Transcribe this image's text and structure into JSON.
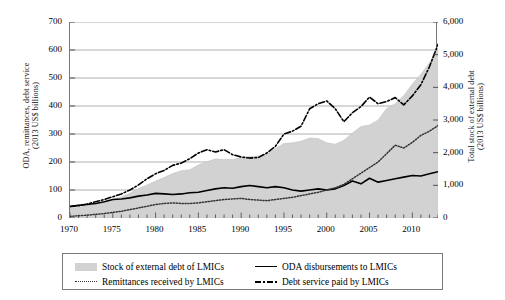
{
  "chart_data": {
    "type": "area",
    "title": "",
    "xlabel": "",
    "ylabel_left": "ODA, remittances, debt service\n(2013 US$ billions)",
    "ylabel_right": "Total stock of external debt\n(2013 US$ billions)",
    "grid": true,
    "legend_position": "bottom",
    "xlim": [
      1970,
      2013
    ],
    "ylim_left": [
      0,
      700
    ],
    "ylim_right": [
      0,
      6000
    ],
    "xticks": [
      1970,
      1975,
      1980,
      1985,
      1990,
      1995,
      2000,
      2005,
      2010
    ],
    "xtick_labels": [
      "1970",
      "1975",
      "1980",
      "1985",
      "1990",
      "1995",
      "2000",
      "2005",
      "2010"
    ],
    "yticks_left": [
      0,
      100,
      200,
      300,
      400,
      500,
      600,
      700
    ],
    "ytick_labels_left": [
      "0",
      "100",
      "200",
      "300",
      "400",
      "500",
      "600",
      "700"
    ],
    "yticks_right": [
      0,
      1000,
      2000,
      3000,
      4000,
      5000,
      6000
    ],
    "ytick_labels_right": [
      "0",
      "1,000",
      "2,000",
      "3,000",
      "4,000",
      "5,000",
      "6,000"
    ],
    "x": [
      1970,
      1971,
      1972,
      1973,
      1974,
      1975,
      1976,
      1977,
      1978,
      1979,
      1980,
      1981,
      1982,
      1983,
      1984,
      1985,
      1986,
      1987,
      1988,
      1989,
      1990,
      1991,
      1992,
      1993,
      1994,
      1995,
      1996,
      1997,
      1998,
      1999,
      2000,
      2001,
      2002,
      2003,
      2004,
      2005,
      2006,
      2007,
      2008,
      2009,
      2010,
      2011,
      2012,
      2013
    ],
    "series": [
      {
        "name": "Stock of external debt of LMICs",
        "style": "area",
        "axis": "right",
        "color": "#d2d2d2",
        "values": [
          290,
          330,
          375,
          430,
          480,
          560,
          650,
          760,
          900,
          1010,
          1130,
          1240,
          1360,
          1450,
          1480,
          1620,
          1720,
          1810,
          1790,
          1790,
          1850,
          1880,
          1900,
          1960,
          2120,
          2280,
          2300,
          2350,
          2450,
          2430,
          2300,
          2260,
          2380,
          2600,
          2800,
          2850,
          3000,
          3350,
          3500,
          3750,
          4100,
          4400,
          4750,
          5200
        ]
      },
      {
        "name": "ODA disbursements to LMICs",
        "style": "solid",
        "axis": "left",
        "color": "#000000",
        "values": [
          42,
          45,
          48,
          52,
          58,
          66,
          68,
          72,
          78,
          82,
          88,
          86,
          84,
          86,
          90,
          92,
          98,
          104,
          108,
          106,
          112,
          116,
          112,
          108,
          112,
          108,
          100,
          96,
          100,
          104,
          100,
          104,
          116,
          132,
          122,
          142,
          128,
          134,
          140,
          146,
          152,
          150,
          158,
          165
        ]
      },
      {
        "name": "Remittances received by LMICs",
        "style": "dotted",
        "axis": "left",
        "color": "#333333",
        "values": [
          6,
          8,
          10,
          13,
          16,
          20,
          24,
          30,
          36,
          42,
          48,
          52,
          54,
          52,
          52,
          54,
          58,
          62,
          66,
          68,
          70,
          66,
          64,
          62,
          66,
          70,
          74,
          80,
          86,
          92,
          100,
          108,
          120,
          140,
          160,
          180,
          200,
          230,
          260,
          250,
          270,
          295,
          310,
          330
        ]
      },
      {
        "name": "Debt service paid by LMICs",
        "style": "dashdot",
        "axis": "left",
        "color": "#000000",
        "values": [
          40,
          44,
          50,
          58,
          66,
          76,
          86,
          100,
          118,
          140,
          158,
          170,
          188,
          196,
          212,
          232,
          244,
          236,
          244,
          226,
          218,
          214,
          216,
          232,
          256,
          300,
          310,
          328,
          390,
          408,
          418,
          390,
          344,
          376,
          398,
          432,
          408,
          416,
          430,
          404,
          436,
          476,
          540,
          620
        ]
      }
    ],
    "legend": [
      {
        "label": "Stock of external debt of LMICs",
        "style": "area"
      },
      {
        "label": "ODA disbursements to LMICs",
        "style": "solid"
      },
      {
        "label": "Remittances received by LMICs",
        "style": "dotted"
      },
      {
        "label": "Debt service paid by LMICs",
        "style": "dashdot"
      }
    ]
  }
}
